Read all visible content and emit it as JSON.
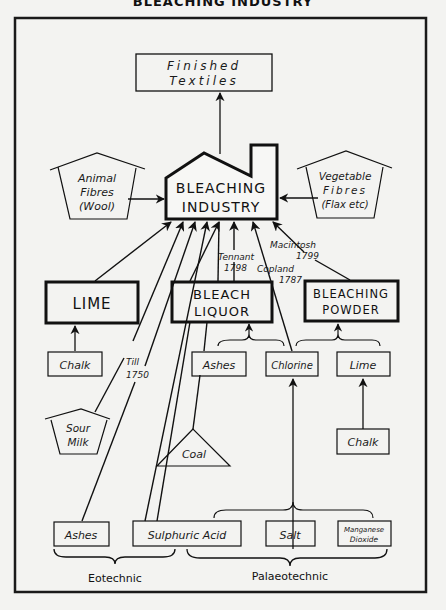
{
  "header": {
    "title": "BLEACHING INDUSTRY"
  },
  "diagram": {
    "finished": {
      "line1": "Finished",
      "line2": "Textiles"
    },
    "industry": {
      "line1": "BLEACHING",
      "line2": "INDUSTRY"
    },
    "animal": {
      "line1": "Animal",
      "line2": "Fibres",
      "line3": "(Wool)"
    },
    "vegetable": {
      "line1": "Vegetable",
      "line2": "Fibres",
      "line3": "(Flax etc)"
    },
    "lime_main": {
      "label": "LIME"
    },
    "bleach_liquor": {
      "line1": "BLEACH",
      "line2": "LIQUOR"
    },
    "bleaching_powder": {
      "line1": "BLEACHING",
      "line2": "POWDER"
    },
    "chalk_left": {
      "label": "Chalk"
    },
    "sour_milk": {
      "line1": "Sour",
      "line2": "Milk"
    },
    "ashes_mid": {
      "label": "Ashes"
    },
    "chlorine": {
      "label": "Chlorine"
    },
    "lime_small": {
      "label": "Lime"
    },
    "chalk_right": {
      "label": "Chalk"
    },
    "coal": {
      "label": "Coal"
    },
    "ashes_bottom": {
      "label": "Ashes"
    },
    "sulphuric_acid": {
      "label": "Sulphuric Acid"
    },
    "salt": {
      "label": "Salt"
    },
    "manganese": {
      "line1": "Manganese",
      "line2": "Dioxide"
    },
    "annotations": {
      "till_1": "Till",
      "till_2": "1750",
      "tennant_1": "Tennant",
      "tennant_2": "1798",
      "copland_1": "Copland",
      "copland_2": "1787",
      "macintosh_1": "Macintosh",
      "macintosh_2": "1799"
    },
    "eras": {
      "eotechnic": "Eotechnic",
      "palaeotechnic": "Palaeotechnic"
    }
  }
}
